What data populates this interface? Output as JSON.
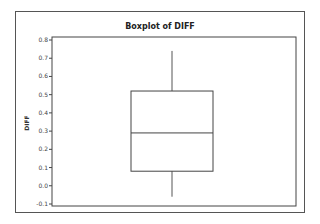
{
  "chart_data": {
    "type": "boxplot",
    "title": "Boxplot of DIFF",
    "xlabel": "",
    "ylabel": "DIFF",
    "ylim": [
      -0.1,
      0.8
    ],
    "yticks": [
      "0.8",
      "0.7",
      "0.6",
      "0.5",
      "0.4",
      "0.3",
      "0.2",
      "0.1",
      "0.0",
      "-0.1"
    ],
    "series": [
      {
        "name": "DIFF",
        "whisker_low": -0.06,
        "q1": 0.08,
        "median": 0.29,
        "q3": 0.52,
        "whisker_high": 0.74
      }
    ],
    "grid": false,
    "legend": null
  },
  "title": "Boxplot of DIFF",
  "ylabel": "DIFF"
}
